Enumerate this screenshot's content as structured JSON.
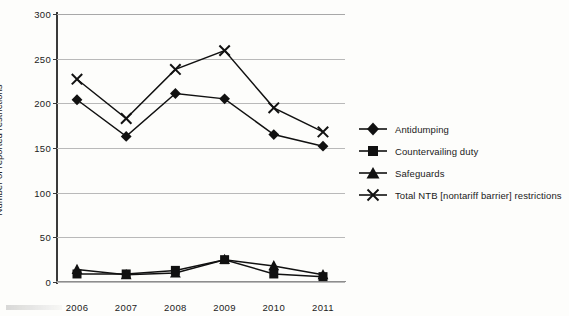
{
  "chart_data": {
    "type": "line",
    "title": "",
    "xlabel": "",
    "ylabel": "Number of reported restrictions",
    "categories": [
      "2006",
      "2007",
      "2008",
      "2009",
      "2010",
      "2011"
    ],
    "ylim": [
      0,
      300
    ],
    "yticks": [
      0,
      50,
      100,
      150,
      200,
      250,
      300
    ],
    "grid": true,
    "legend_position": "right",
    "series": [
      {
        "name": "Antidumping",
        "marker": "diamond",
        "values": [
          204,
          163,
          211,
          205,
          165,
          152
        ]
      },
      {
        "name": "Countervailing duty",
        "marker": "square",
        "values": [
          9,
          9,
          13,
          25,
          9,
          6
        ]
      },
      {
        "name": "Safeguards",
        "marker": "triangle",
        "values": [
          14,
          8,
          10,
          25,
          18,
          8
        ]
      },
      {
        "name": "Total NTB [nontariff barrier] restrictions",
        "marker": "x",
        "values": [
          227,
          183,
          238,
          259,
          195,
          168
        ]
      }
    ]
  },
  "axis": {
    "y_tick_labels": [
      "0",
      "50",
      "100",
      "150",
      "200",
      "250",
      "300"
    ],
    "x_tick_labels": [
      "2006",
      "2007",
      "2008",
      "2009",
      "2010",
      "2011"
    ],
    "y_axis_title": "Number of reported restrictions"
  },
  "legend": {
    "items": [
      {
        "label": "Antidumping",
        "marker": "diamond-marker-icon"
      },
      {
        "label": "Countervailing duty",
        "marker": "square-marker-icon"
      },
      {
        "label": "Safeguards",
        "marker": "triangle-marker-icon"
      },
      {
        "label": "Total NTB [nontariff barrier] restrictions",
        "marker": "x-marker-icon"
      }
    ]
  },
  "colors": {
    "series": "#111111",
    "gridline": "#b9b9b9",
    "axis": "#3a3a3a",
    "background": "#fdfdfb",
    "text": "#1a1a1a"
  }
}
